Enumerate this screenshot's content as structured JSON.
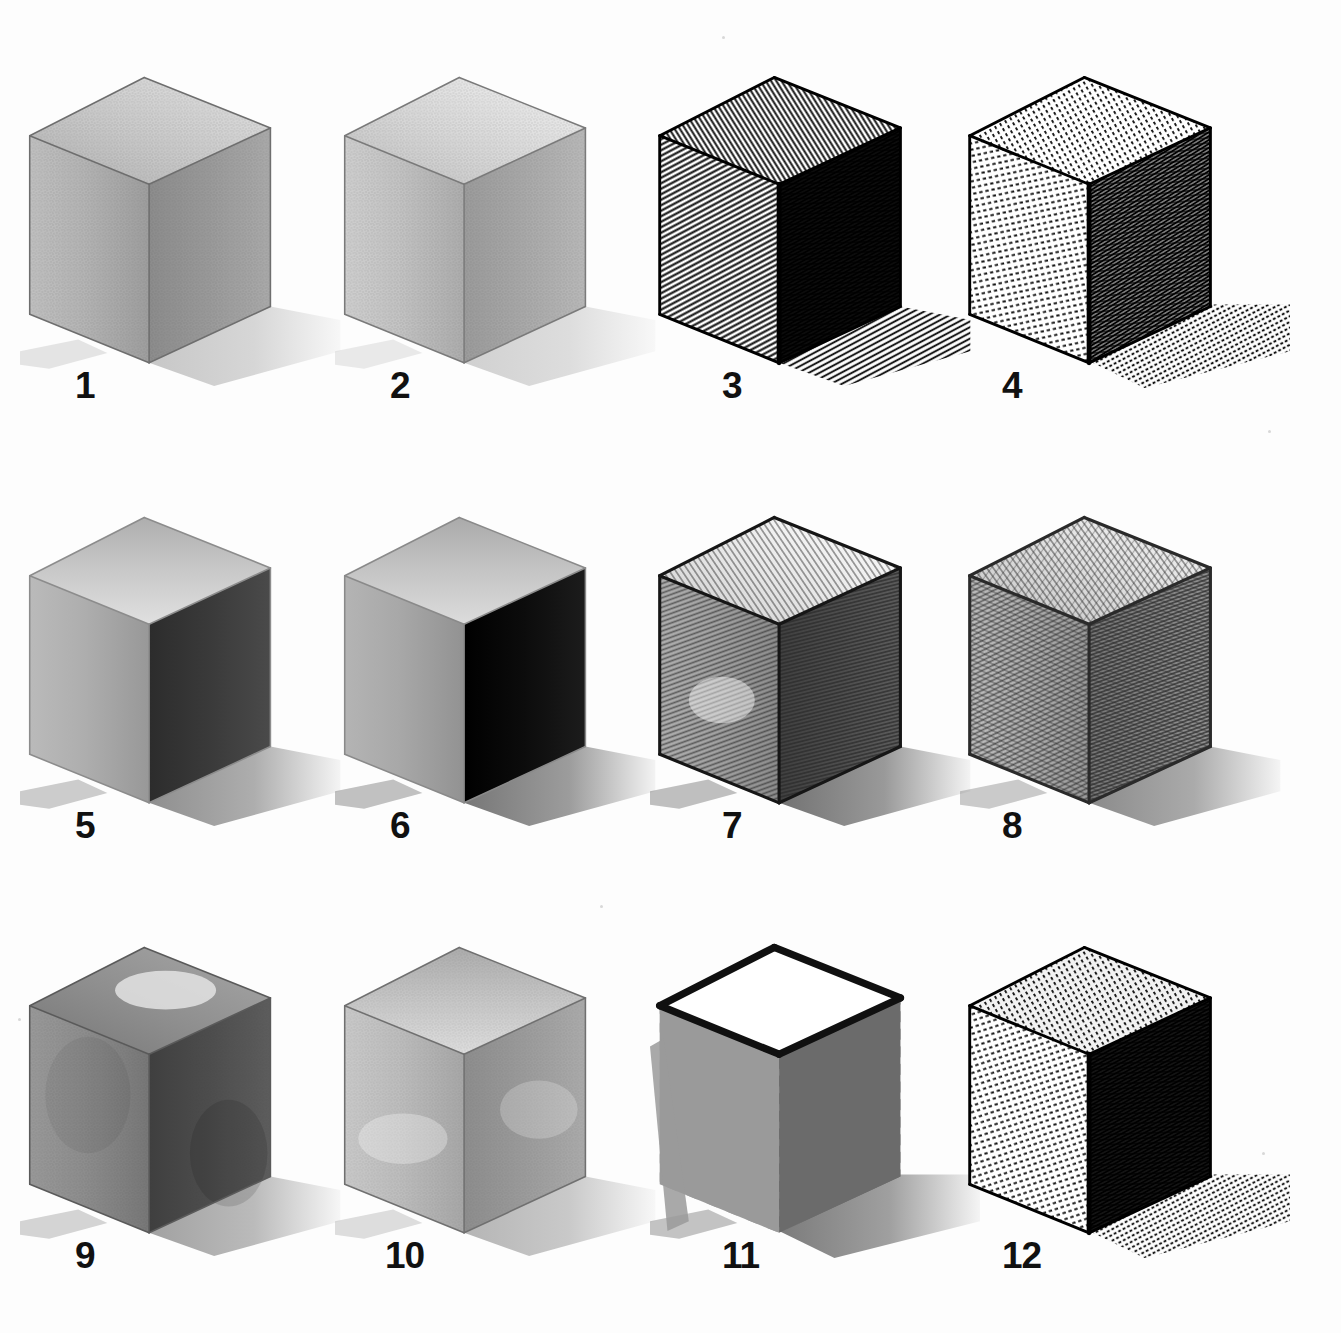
{
  "plate": {
    "title": "Twelve shaded cubes rendered in different drawing media",
    "background_color": "#fdfdfd",
    "label_color": "#111111",
    "rows": 3,
    "columns": 4,
    "total_cubes": 12
  },
  "cubes": [
    {
      "label": "1",
      "medium": "graphite pencil, smooth blended tone",
      "top_tone": "#c9c9c9",
      "left_tone": "#b4b4b4",
      "right_tone": "#9a9a9a",
      "outline_tone": "#6e6e6e",
      "shadow_tone": "#9b9b9b",
      "shadow_opacity": 0.55,
      "texture": "grain",
      "top_lightest_corner": "back"
    },
    {
      "label": "2",
      "medium": "graphite pencil, light blended tone",
      "top_tone": "#d8d8d8",
      "left_tone": "#c3c3c3",
      "right_tone": "#a9a9a9",
      "outline_tone": "#7a7a7a",
      "shadow_tone": "#a4a4a4",
      "shadow_opacity": 0.5,
      "texture": "grain",
      "top_lightest_corner": "back"
    },
    {
      "label": "3",
      "medium": "pen and ink, dense parallel line hatching",
      "top_tone": "#ffffff",
      "left_tone": "#ffffff",
      "right_tone": "#1a1a1a",
      "outline_tone": "#000000",
      "shadow_tone": "#1a1a1a",
      "shadow_opacity": 1,
      "texture": "hatch-ink",
      "hatch_angle_top": -32,
      "hatch_angle_left": 62,
      "hatch_angle_right": 62
    },
    {
      "label": "4",
      "medium": "pen and ink, hatching with dashes and stipple",
      "top_tone": "#ffffff",
      "left_tone": "#ffffff",
      "right_tone": "#ffffff",
      "outline_tone": "#000000",
      "shadow_tone": "#111111",
      "shadow_opacity": 1,
      "texture": "hatch-dash",
      "hatch_angle_top": -30,
      "hatch_angle_left": 78,
      "hatch_angle_right": 58
    },
    {
      "label": "5",
      "medium": "wash / gouache, flat even tones",
      "top_tone": "#c6c6c6",
      "left_tone": "#aeaeae",
      "right_tone": "#3a3a3a",
      "outline_tone": "#8c8c8c",
      "shadow_tone": "#6a6a6a",
      "shadow_opacity": 0.75,
      "texture": "flat",
      "top_lightest_corner": "front"
    },
    {
      "label": "6",
      "medium": "wash / gouache, maximum contrast dark side",
      "top_tone": "#c2c2c2",
      "left_tone": "#a8a8a8",
      "right_tone": "#0c0c0c",
      "outline_tone": "#8a8a8a",
      "shadow_tone": "#555555",
      "shadow_opacity": 0.8,
      "texture": "flat",
      "top_lightest_corner": "front"
    },
    {
      "label": "7",
      "medium": "pencil hatching, directional strokes",
      "top_tone": "#e6e6e6",
      "left_tone": "#a2a2a2",
      "right_tone": "#4f4f4f",
      "outline_tone": "#161616",
      "shadow_tone": "#5a5a5a",
      "shadow_opacity": 0.85,
      "texture": "hatch-pencil",
      "hatch_angle_top": -34,
      "hatch_angle_left": 70,
      "hatch_angle_right": 76
    },
    {
      "label": "8",
      "medium": "pencil crosshatching",
      "top_tone": "#dcdcdc",
      "left_tone": "#b0b0b0",
      "right_tone": "#8a8a8a",
      "outline_tone": "#2a2a2a",
      "shadow_tone": "#6e6e6e",
      "shadow_opacity": 0.8,
      "texture": "crosshatch-pencil",
      "hatch_angle_top": -36,
      "hatch_angle_left": 64,
      "hatch_angle_right": 70
    },
    {
      "label": "9",
      "medium": "watercolour wash, mottled mid tones",
      "top_tone": "#8e8e8e",
      "left_tone": "#8d8d8d",
      "right_tone": "#4d4d4d",
      "outline_tone": "#5a5a5a",
      "shadow_tone": "#8a8a8a",
      "shadow_opacity": 0.8,
      "texture": "wash",
      "top_lightest_corner": "center"
    },
    {
      "label": "10",
      "medium": "charcoal / soft pencil, smudged tone",
      "top_tone": "#c4c4c4",
      "left_tone": "#bdbdbd",
      "right_tone": "#9b9b9b",
      "outline_tone": "#707070",
      "shadow_tone": "#9d9d9d",
      "shadow_opacity": 0.75,
      "texture": "smudge",
      "top_lightest_corner": "front"
    },
    {
      "label": "11",
      "medium": "brush marker, bold diagonal strokes, white top",
      "top_tone": "#ffffff",
      "left_tone": "#9a9a9a",
      "right_tone": "#6b6b6b",
      "outline_tone": "#101010",
      "shadow_tone": "#6d6d6d",
      "shadow_opacity": 0.9,
      "texture": "bold-stroke",
      "hatch_angle_left": 62,
      "hatch_angle_right": 62
    },
    {
      "label": "12",
      "medium": "pen and ink, graded hatching with dashes",
      "top_tone": "#f2f2f2",
      "left_tone": "#ffffff",
      "right_tone": "#2b2b2b",
      "outline_tone": "#000000",
      "shadow_tone": "#1c1c1c",
      "shadow_opacity": 1,
      "texture": "hatch-dash",
      "hatch_angle_top": -30,
      "hatch_angle_left": 72,
      "hatch_angle_right": 62
    }
  ],
  "labels": {
    "row1": [
      "1",
      "2",
      "3",
      "4"
    ],
    "row2": [
      "5",
      "6",
      "7",
      "8"
    ],
    "row3": [
      "9",
      "10",
      "11",
      "12"
    ]
  }
}
